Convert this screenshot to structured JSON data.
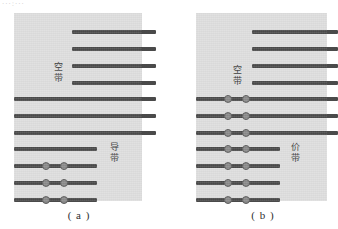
{
  "figure": {
    "top_artifact_text": "···:···",
    "background_color": "#ffffff",
    "panel_color": "#dedede",
    "line_color": "#4a4a4a",
    "electron_color": "#8a8a8a"
  },
  "panel_a": {
    "caption": "( a )",
    "labels": {
      "empty_band": {
        "chars": [
          "空",
          "带"
        ],
        "text": "空带"
      },
      "conduction_band": {
        "chars": [
          "导",
          "带"
        ],
        "text": "导带"
      }
    },
    "lines": [
      {
        "x": 58,
        "y": 17,
        "w": 84,
        "h": 4,
        "electrons": []
      },
      {
        "x": 58,
        "y": 34,
        "w": 84,
        "h": 4,
        "electrons": []
      },
      {
        "x": 58,
        "y": 51,
        "w": 84,
        "h": 4,
        "electrons": []
      },
      {
        "x": 58,
        "y": 68,
        "w": 84,
        "h": 4,
        "electrons": []
      },
      {
        "x": 0,
        "y": 84,
        "w": 142,
        "h": 4,
        "electrons": []
      },
      {
        "x": 0,
        "y": 101,
        "w": 142,
        "h": 4,
        "electrons": []
      },
      {
        "x": 0,
        "y": 118,
        "w": 142,
        "h": 4,
        "electrons": []
      },
      {
        "x": 0,
        "y": 134,
        "w": 83,
        "h": 4,
        "electrons": []
      },
      {
        "x": 0,
        "y": 151,
        "w": 83,
        "h": 4,
        "electrons": [
          28,
          46
        ]
      },
      {
        "x": 0,
        "y": 168,
        "w": 83,
        "h": 4,
        "electrons": [
          28,
          46
        ]
      },
      {
        "x": 0,
        "y": 185,
        "w": 83,
        "h": 4,
        "electrons": [
          28,
          46
        ]
      }
    ]
  },
  "panel_b": {
    "caption": "( b )",
    "labels": {
      "empty_band": {
        "chars": [
          "空",
          "带"
        ],
        "text": "空带"
      },
      "valence_band": {
        "chars": [
          "价",
          "带"
        ],
        "text": "价带"
      }
    },
    "lines": [
      {
        "x": 56,
        "y": 17,
        "w": 86,
        "h": 4,
        "electrons": []
      },
      {
        "x": 56,
        "y": 34,
        "w": 86,
        "h": 4,
        "electrons": []
      },
      {
        "x": 56,
        "y": 51,
        "w": 86,
        "h": 4,
        "electrons": []
      },
      {
        "x": 56,
        "y": 68,
        "w": 86,
        "h": 4,
        "electrons": []
      },
      {
        "x": 0,
        "y": 84,
        "w": 142,
        "h": 4,
        "electrons": [
          28,
          46
        ]
      },
      {
        "x": 0,
        "y": 101,
        "w": 142,
        "h": 4,
        "electrons": [
          28,
          46
        ]
      },
      {
        "x": 0,
        "y": 118,
        "w": 142,
        "h": 4,
        "electrons": [
          28,
          46
        ]
      },
      {
        "x": 0,
        "y": 134,
        "w": 84,
        "h": 4,
        "electrons": [
          28,
          46
        ]
      },
      {
        "x": 0,
        "y": 151,
        "w": 84,
        "h": 4,
        "electrons": [
          28,
          46
        ]
      },
      {
        "x": 0,
        "y": 168,
        "w": 84,
        "h": 4,
        "electrons": [
          28,
          46
        ]
      },
      {
        "x": 0,
        "y": 185,
        "w": 84,
        "h": 4,
        "electrons": [
          28,
          46
        ]
      }
    ]
  }
}
